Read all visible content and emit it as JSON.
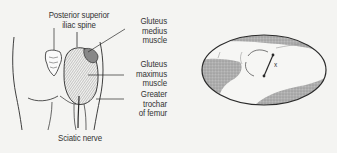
{
  "figure": {
    "left_panel": {
      "title": "Gluteal region, posterior view",
      "labels": {
        "posterior_superior_iliac_spine": "Posterior superior\niliac spine",
        "gluteus_medius": "Gluteus\nmedius\nmuscle",
        "gluteus_maximus": "Gluteus\nmaximus\nmuscle",
        "greater_trochanter": "Greater\ntrochar\nof femur",
        "sciatic_nerve": "Sciatic nerve"
      }
    },
    "right_panel": {
      "title": "Oval inset with injection site",
      "marker": "x"
    },
    "colors": {
      "line": "#2a2a2a",
      "shading": "#a8a8a8",
      "background": "#f4f4f2"
    }
  }
}
